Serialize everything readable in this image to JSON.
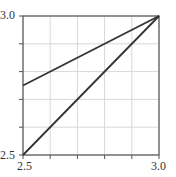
{
  "chart_data": {
    "type": "line",
    "title": "",
    "xlabel": "",
    "ylabel": "",
    "xlim": [
      2.5,
      3.0
    ],
    "ylim": [
      2.5,
      3.0
    ],
    "grid": true,
    "x_ticks": [
      2.5,
      2.6,
      2.7,
      2.8,
      2.9,
      3.0
    ],
    "y_ticks": [
      2.5,
      2.6,
      2.7,
      2.8,
      2.9,
      3.0
    ],
    "x_tick_labels": [
      "2.5",
      "3.0"
    ],
    "y_tick_labels": [
      "2.5",
      "3.0"
    ],
    "series": [
      {
        "name": "upper-line",
        "x": [
          2.5,
          3.0
        ],
        "y": [
          2.75,
          3.0
        ]
      },
      {
        "name": "diagonal-line",
        "x": [
          2.5,
          3.0
        ],
        "y": [
          2.5,
          3.0
        ]
      }
    ],
    "legend": null
  },
  "labels": {
    "y_top": "3.0",
    "y_bottom": "2.5",
    "x_left": "2.5",
    "x_right": "3.0"
  },
  "colors": {
    "line": "#333333",
    "axis": "#555555",
    "grid": "#d8d8d8"
  }
}
